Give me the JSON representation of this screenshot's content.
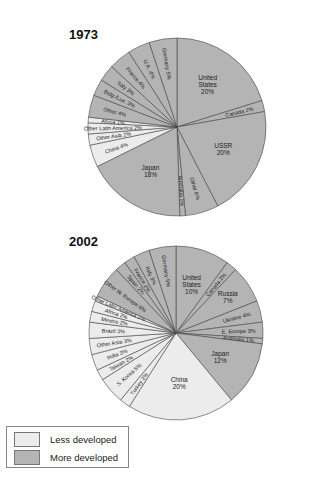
{
  "colors": {
    "less_developed": "#ececec",
    "more_developed": "#b4b4b4",
    "stroke": "#444444"
  },
  "legend": {
    "items": [
      {
        "label": "Less developed",
        "color": "#ececec"
      },
      {
        "label": "More developed",
        "color": "#b4b4b4"
      }
    ]
  },
  "chart_data": [
    {
      "type": "pie",
      "title": "1973",
      "slices": [
        {
          "label": "United States",
          "value": 20,
          "group": "More developed"
        },
        {
          "label": "Canada",
          "value": 2,
          "group": "More developed"
        },
        {
          "label": "USSR",
          "value": 20,
          "group": "More developed"
        },
        {
          "label": "Other",
          "value": 6,
          "group": "More developed"
        },
        {
          "label": "Australia",
          "value": 1,
          "group": "More developed"
        },
        {
          "label": "Japan",
          "value": 18,
          "group": "More developed"
        },
        {
          "label": "China",
          "value": 4,
          "group": "Less developed"
        },
        {
          "label": "Other Asia",
          "value": 2,
          "group": "Less developed"
        },
        {
          "label": "Other Latin America",
          "value": 2,
          "group": "Less developed"
        },
        {
          "label": "Africa",
          "value": 1,
          "group": "Less developed"
        },
        {
          "label": "Other",
          "value": 4,
          "group": "More developed"
        },
        {
          "label": "Belg./Lux.",
          "value": 3,
          "group": "More developed"
        },
        {
          "label": "Italy",
          "value": 3,
          "group": "More developed"
        },
        {
          "label": "France",
          "value": 4,
          "group": "More developed"
        },
        {
          "label": "U.K.",
          "value": 4,
          "group": "More developed"
        },
        {
          "label": "Germany",
          "value": 5,
          "group": "More developed"
        }
      ]
    },
    {
      "type": "pie",
      "title": "2002",
      "slices": [
        {
          "label": "United States",
          "value": 10,
          "group": "More developed"
        },
        {
          "label": "Canada",
          "value": 2,
          "group": "More developed"
        },
        {
          "label": "Russia",
          "value": 7,
          "group": "More developed"
        },
        {
          "label": "Ukraine",
          "value": 4,
          "group": "More developed"
        },
        {
          "label": "E. Europe",
          "value": 3,
          "group": "More developed"
        },
        {
          "label": "Australia",
          "value": 1,
          "group": "More developed"
        },
        {
          "label": "Japan",
          "value": 12,
          "group": "More developed"
        },
        {
          "label": "China",
          "value": 20,
          "group": "Less developed"
        },
        {
          "label": "Turkey",
          "value": 2,
          "group": "Less developed"
        },
        {
          "label": "S. Korea",
          "value": 5,
          "group": "Less developed"
        },
        {
          "label": "Taiwan",
          "value": 2,
          "group": "Less developed"
        },
        {
          "label": "India",
          "value": 3,
          "group": "Less developed"
        },
        {
          "label": "Other Asia",
          "value": 3,
          "group": "Less developed"
        },
        {
          "label": "Brazil",
          "value": 3,
          "group": "Less developed"
        },
        {
          "label": "Mexico",
          "value": 2,
          "group": "Less developed"
        },
        {
          "label": "Africa",
          "value": 2,
          "group": "Less developed"
        },
        {
          "label": "Other Latin America",
          "value": 1,
          "group": "Less developed"
        },
        {
          "label": "Other W. Europe",
          "value": 6,
          "group": "More developed"
        },
        {
          "label": "Spain",
          "value": 2,
          "group": "More developed"
        },
        {
          "label": "France",
          "value": 2,
          "group": "More developed"
        },
        {
          "label": "Italy",
          "value": 3,
          "group": "More developed"
        },
        {
          "label": "Germany",
          "value": 5,
          "group": "More developed"
        }
      ]
    }
  ]
}
